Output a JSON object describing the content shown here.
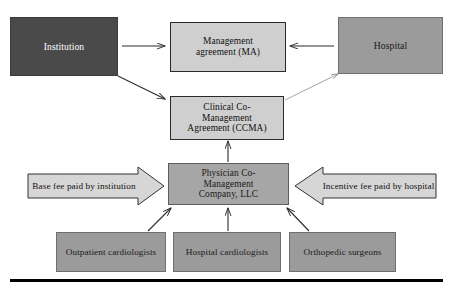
{
  "diagram": {
    "nodes": {
      "institution": {
        "label": "Institution",
        "fill": "#4a4a4a",
        "text_color": "#ffffff"
      },
      "management_agreement": {
        "label": "Management agreement (MA)",
        "line1": "Management",
        "line2": "agreement (MA)",
        "fill": "#cfcfcf",
        "text_color": "#101010"
      },
      "hospital": {
        "label": "Hospital",
        "fill": "#9b9b9b",
        "text_color": "#1a1a1a"
      },
      "ccma": {
        "label": "Clinical Co-Management Agreement (CCMA)",
        "line1": "Clinical Co-Management",
        "line2": "Agreement (CCMA)",
        "fill": "#cfcfcf",
        "text_color": "#101010"
      },
      "pcmc": {
        "label": "Physician Co-Management Company, LLC",
        "line1": "Physician Co-Management",
        "line2": "Company, LLC",
        "fill": "#a6a6a6",
        "text_color": "#1a1a1a"
      },
      "outpatient_cardiologists": {
        "label": "Outpatient cardiologists",
        "fill": "#9b9b9b",
        "text_color": "#1a1a1a"
      },
      "hospital_cardiologists": {
        "label": "Hospital cardiologists",
        "fill": "#9b9b9b",
        "text_color": "#1a1a1a"
      },
      "orthopedic_surgeons": {
        "label": "Orthopedic surgeons",
        "fill": "#9b9b9b",
        "text_color": "#1a1a1a"
      }
    },
    "flow_arrows": {
      "base_fee": {
        "label": "Base fee paid by institution",
        "direction": "right",
        "fill": "#d6d6d6"
      },
      "incentive_fee": {
        "label": "Incentive fee paid by hospital",
        "direction": "left",
        "fill": "#d6d6d6"
      }
    },
    "connectors": [
      {
        "name": "institution-to-management-agreement",
        "style": "solid",
        "from": "institution",
        "to": "management_agreement"
      },
      {
        "name": "hospital-to-management-agreement",
        "style": "solid",
        "from": "hospital",
        "to": "management_agreement"
      },
      {
        "name": "institution-to-ccma",
        "style": "solid",
        "from": "institution",
        "to": "ccma"
      },
      {
        "name": "ccma-to-hospital",
        "style": "thin",
        "from": "ccma",
        "to": "hospital"
      },
      {
        "name": "pcmc-to-ccma",
        "style": "solid",
        "from": "pcmc",
        "to": "ccma"
      },
      {
        "name": "outpatient-cardiologists-to-pcmc",
        "style": "solid",
        "from": "outpatient_cardiologists",
        "to": "pcmc"
      },
      {
        "name": "hospital-cardiologists-to-pcmc",
        "style": "solid",
        "from": "hospital_cardiologists",
        "to": "pcmc"
      },
      {
        "name": "orthopedic-surgeons-to-pcmc",
        "style": "solid",
        "from": "orthopedic_surgeons",
        "to": "pcmc"
      }
    ]
  }
}
